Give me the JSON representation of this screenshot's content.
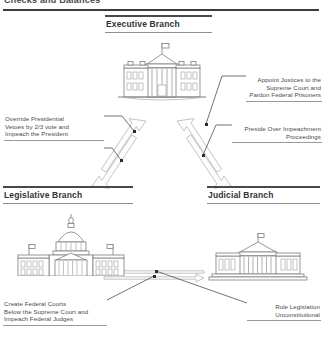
{
  "page": {
    "title": "Checks and Balances"
  },
  "branches": [
    {
      "id": "executive",
      "label": "Executive Branch",
      "building_icon": "white-house-icon"
    },
    {
      "id": "legislative",
      "label": "Legislative Branch",
      "building_icon": "capitol-building-icon"
    },
    {
      "id": "judicial",
      "label": "Judicial Branch",
      "building_icon": "supreme-court-icon"
    }
  ],
  "notes": [
    {
      "id": "appoint",
      "text": "Appoint Justices to the\nSupreme Court and\nPardon Federal Prisoners",
      "align": "right",
      "from": "executive",
      "to": "judicial"
    },
    {
      "id": "preside",
      "text": "Preside Over Impeachment\nProceedings",
      "align": "right",
      "from": "judicial",
      "to": "executive"
    },
    {
      "id": "override",
      "text": "Override Presidential\nVetoes by 2/3 vote and\nImpeach the President",
      "align": "left",
      "from": "legislative",
      "to": "executive"
    },
    {
      "id": "create",
      "text": "Create Federal Courts\nBelow the Supreme Court and\nImpeach Federal Judges",
      "align": "left",
      "from": "legislative",
      "to": "judicial"
    },
    {
      "id": "rule",
      "text": "Rule Legislation\nUnconstitutional",
      "align": "right",
      "from": "judicial",
      "to": "legislative"
    }
  ],
  "colors": {
    "rule_dark": "#3c3c3c",
    "rule_light": "#9a9a9a",
    "text": "#4c4c4c",
    "heading": "#333333",
    "arrow_stroke": "#b9b9b9",
    "arrow_fill": "#ffffff",
    "building_stroke": "#7b7b7b",
    "leader_line": "#555555",
    "dot": "#2e2e2e"
  }
}
